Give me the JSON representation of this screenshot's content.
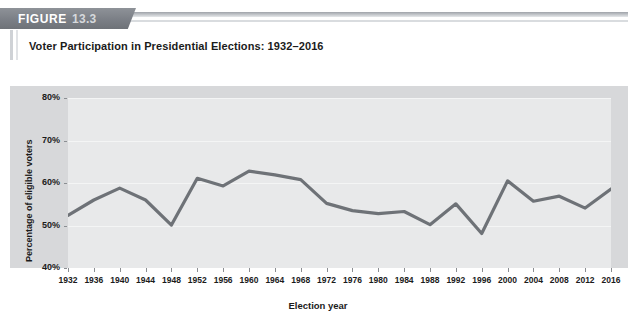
{
  "figure": {
    "banner_word": "FIGURE",
    "banner_number": "13.3",
    "title": "Voter Participation in Presidential Elections: 1932–2016"
  },
  "colors": {
    "banner": "#7b7f86",
    "panel": "#d7d8da",
    "plot": "#e8e9ea",
    "gridline": "#f4f5f5",
    "line": "#6e7277",
    "text": "#1b1b1b"
  },
  "chart_data": {
    "type": "line",
    "title": "Voter Participation in Presidential Elections: 1932–2016",
    "xlabel": "Election year",
    "ylabel": "Percentage of eligible voters",
    "ylim": [
      40,
      80
    ],
    "yticks": [
      40,
      50,
      60,
      70,
      80
    ],
    "ytick_labels": [
      "40%",
      "50%",
      "60%",
      "70%",
      "80%"
    ],
    "grid": true,
    "legend": "none",
    "categories": [
      "1932",
      "1936",
      "1940",
      "1944",
      "1948",
      "1952",
      "1956",
      "1960",
      "1964",
      "1968",
      "1972",
      "1976",
      "1980",
      "1984",
      "1988",
      "1992",
      "1996",
      "2000",
      "2004",
      "2008",
      "2012",
      "2016"
    ],
    "values": [
      52.4,
      56.0,
      58.8,
      56.0,
      50.1,
      61.1,
      59.3,
      62.8,
      61.9,
      60.8,
      55.2,
      53.5,
      52.8,
      53.3,
      50.2,
      55.1,
      48.1,
      60.5,
      55.7,
      56.9,
      54.1,
      58.6
    ],
    "units": "percent"
  }
}
